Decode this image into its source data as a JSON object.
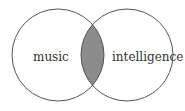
{
  "diagram": {
    "type": "venn",
    "sets": [
      {
        "label": "music",
        "cx": 58,
        "cy": 55,
        "r": 46
      },
      {
        "label": "intelligence",
        "cx": 127,
        "cy": 55,
        "r": 46
      }
    ],
    "intersection_fill": "#8c8c8c",
    "stroke": "#555555"
  }
}
